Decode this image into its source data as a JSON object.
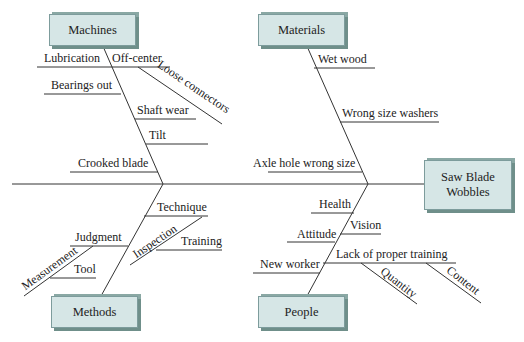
{
  "effect": {
    "label_line1": "Saw Blade",
    "label_line2": "Wobbles"
  },
  "categories": {
    "machines": {
      "label": "Machines",
      "causes": [
        "Lubrication",
        "Off-center",
        "Loose connectors",
        "Bearings out",
        "Shaft wear",
        "Tilt",
        "Crooked blade"
      ]
    },
    "materials": {
      "label": "Materials",
      "causes": [
        "Wet wood",
        "Wrong size washers",
        "Axle hole wrong size"
      ]
    },
    "methods": {
      "label": "Methods",
      "causes": [
        "Technique",
        "Inspection",
        "Training",
        "Judgment",
        "Measurement",
        "Tool"
      ]
    },
    "people": {
      "label": "People",
      "causes": [
        "Health",
        "Vision",
        "Attitude",
        "Lack of proper training",
        "Quantity",
        "Content",
        "New worker"
      ]
    }
  },
  "colors": {
    "box_fill": "#d6e6e6",
    "box_shadow": "#6f8f8a",
    "line": "#333333"
  }
}
